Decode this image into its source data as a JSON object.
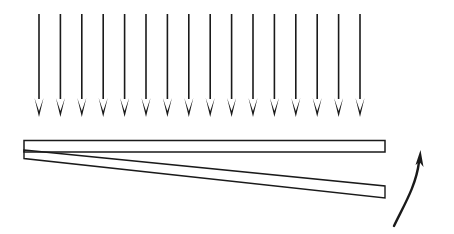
{
  "figure": {
    "background_color": "#ffffff",
    "ink_color": "#1a1a1a",
    "canvas": {
      "width": 454,
      "height": 234
    }
  },
  "load_arrows": {
    "name": "distributed-load-arrows",
    "count": 16,
    "direction": "down",
    "color": "#1a1a1a",
    "shaft_width": 1.6,
    "head_width": 9,
    "head_length": 19,
    "head_notch": 6,
    "start_x": 39,
    "spacing_x": 21.4,
    "top_y": 14,
    "shaft_bottom_y": 99,
    "tip_y": 117,
    "x_positions": [
      39,
      60.4,
      81.8,
      103.2,
      124.6,
      146,
      167.4,
      188.8,
      210.2,
      231.6,
      253,
      274.4,
      295.8,
      317.2,
      338.6,
      360
    ]
  },
  "undeformed_beam": {
    "name": "undeformed-beam",
    "label": "undeformed beam",
    "color": "#1a1a1a",
    "stroke_width": 1.5,
    "left_x": 24,
    "right_x": 385,
    "top_y": 140.5,
    "bottom_y": 152
  },
  "deflected_beam": {
    "name": "deflected-beam",
    "label": "deflected beam",
    "color": "#1a1a1a",
    "stroke_width": 1.4,
    "hinge_x": 24,
    "hinge_top_y": 150,
    "hinge_bottom_y": 158.5,
    "tip_x": 385,
    "tip_top_y": 186,
    "tip_bottom_y": 198
  },
  "rotation_arrow": {
    "name": "rotation-arrow",
    "label": "rotation direction",
    "color": "#1a1a1a",
    "stroke_width": 2.4,
    "tail_x": 394,
    "tail_y": 226,
    "control1_x": 404,
    "control1_y": 205,
    "control2_x": 416,
    "control2_y": 186,
    "tip_x": 420.5,
    "tip_y": 150,
    "head_width": 9,
    "head_length": 15
  }
}
